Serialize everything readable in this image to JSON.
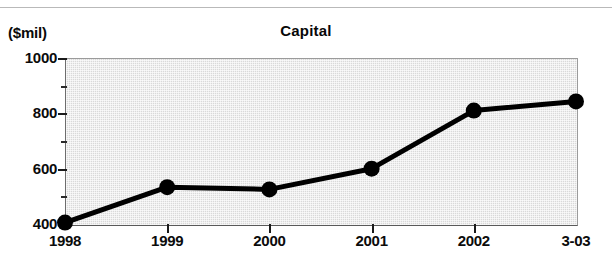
{
  "chart_data": {
    "type": "line",
    "title": "Capital",
    "unit_label": "($mil)",
    "xlabel": "",
    "ylabel": "",
    "categories": [
      "1998",
      "1999",
      "2000",
      "2001",
      "2002",
      "3-03"
    ],
    "values": [
      405,
      533,
      525,
      600,
      810,
      843
    ],
    "series": [
      {
        "name": "Capital",
        "values": [
          405,
          533,
          525,
          600,
          810,
          843
        ]
      }
    ],
    "ylim": [
      400,
      1000
    ],
    "ytick_labels": [
      "400",
      "600",
      "800",
      "1000"
    ],
    "ytick_values": [
      400,
      600,
      800,
      1000
    ],
    "yminor_values": [
      500,
      700,
      900
    ],
    "grid": false,
    "legend": "none",
    "plot_background": "#d9d9d9",
    "line_color": "#000000",
    "marker": "circle",
    "marker_color": "#000000"
  },
  "figure": {
    "background": "#ffffff",
    "title_weight": "bold"
  }
}
